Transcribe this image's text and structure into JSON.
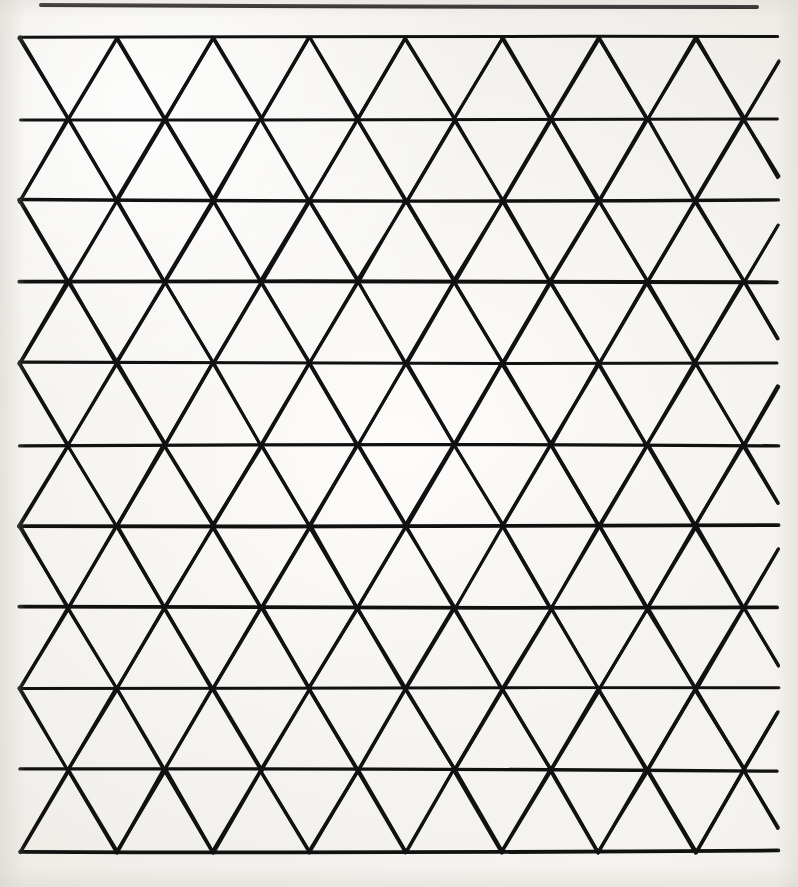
{
  "page": {
    "width": 798,
    "height": 887,
    "background_color": "#f2f0ec",
    "ink_color": "#111111",
    "caption": ""
  },
  "header_rule": {
    "name": "horizontal-rule",
    "x1": 41,
    "y1": 5,
    "x2": 757,
    "y2": 7,
    "stroke_width": 4
  },
  "figure": {
    "title": "",
    "type": "triangular-grid",
    "geometry": {
      "left": 20,
      "right": 778,
      "top": 38,
      "bottom": 852,
      "row_count": 11,
      "row_spacing": 81.4,
      "column_spacing": 96.5,
      "column_offset": 48.25,
      "columns_per_row": 9,
      "stroke_width": 3.4,
      "stroke_color": "#111111"
    },
    "rows_y": [
      38,
      119,
      201,
      282,
      363,
      445,
      526,
      608,
      689,
      770,
      852
    ],
    "vertex_x_even": [
      20,
      116.5,
      213,
      309.5,
      406,
      502.5,
      599,
      695.5,
      778
    ],
    "vertex_x_odd": [
      20,
      68.25,
      164.75,
      261.25,
      357.75,
      454.25,
      550.75,
      647.25,
      743.75,
      778
    ]
  },
  "chart_data": {
    "type": "line",
    "xlabel": "",
    "ylabel": "",
    "xlim": [
      20,
      778
    ],
    "ylim": [
      38,
      852
    ],
    "grid": true,
    "legend": "none",
    "series": [
      {
        "name": "horizontal lines",
        "count": 11,
        "spacing": 81.4
      },
      {
        "name": "down-right diagonals",
        "count": 18,
        "angle_deg": 59.4
      },
      {
        "name": "down-left diagonals",
        "count": 18,
        "angle_deg": -59.4
      }
    ],
    "annotations": []
  }
}
